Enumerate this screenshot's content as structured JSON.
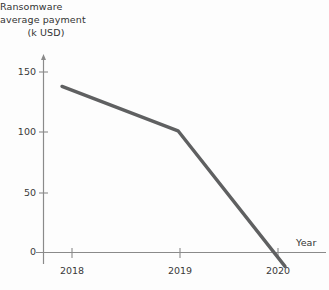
{
  "chart_data": {
    "type": "line",
    "title": "",
    "ylabel_lines": [
      "Ransomware",
      "average payment",
      "(k USD)"
    ],
    "ylabel": "Ransomware average payment (k USD)",
    "xlabel": "Year",
    "categories": [
      "2018",
      "2019",
      "2020"
    ],
    "x": [
      2018,
      2019,
      2020
    ],
    "values": [
      12,
      49,
      162
    ],
    "series": [
      {
        "name": "Ransomware average payment",
        "values": [
          12,
          49,
          162
        ]
      }
    ],
    "yticks": [
      "0",
      "50",
      "100",
      "150"
    ],
    "ytick_values": [
      0,
      50,
      100,
      150
    ],
    "xticks": [
      "2018",
      "2019",
      "2020"
    ],
    "ylim": [
      0,
      170
    ],
    "xlim": [
      2017.7,
      2020.45
    ],
    "grid": false,
    "legend": "none",
    "line_color": "#5f6061",
    "axis_color": "#7a7a7a",
    "background_color": "#fdfdfd"
  },
  "axes": {
    "y_title_line1": "Ransomware",
    "y_title_line2": "average payment",
    "y_title_line3": "(k USD)",
    "x_title": "Year"
  },
  "ticks": {
    "y": [
      {
        "label": "150",
        "y": 72
      },
      {
        "label": "100",
        "y": 132
      },
      {
        "label": "50",
        "y": 193
      },
      {
        "label": "0",
        "y": 252
      }
    ],
    "x": [
      {
        "label": "2018",
        "x": 72
      },
      {
        "label": "2019",
        "x": 180
      },
      {
        "label": "2020",
        "x": 278
      }
    ]
  }
}
